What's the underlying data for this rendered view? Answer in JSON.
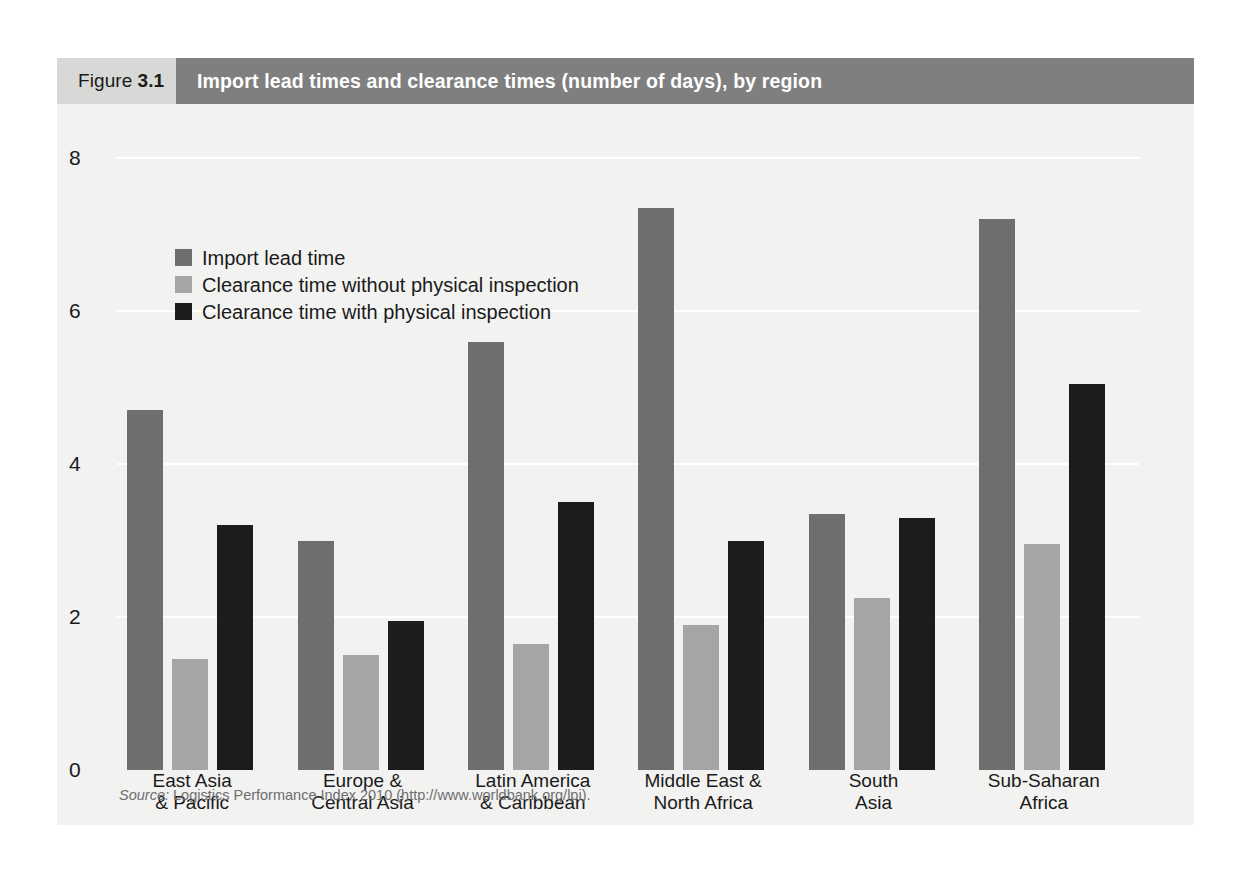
{
  "figure": {
    "label": "Figure",
    "number": "3.1",
    "title": "Import lead times and clearance times (number of days), by region",
    "source_word": "Source:",
    "source_text": " Logistics Performance Index 2010 (http://www.worldbank.org/lpi)."
  },
  "colors": {
    "header_number_bg": "#d8d8d6",
    "header_title_bg": "#7f7f7f",
    "panel_bg": "#f2f2f1",
    "series_import_lead_time": "#6e6e6e",
    "series_clearance_without": "#a5a5a5",
    "series_clearance_with": "#1c1c1c",
    "gridline": "#ffffff"
  },
  "chart_data": {
    "type": "bar",
    "title": "Import lead times and clearance times (number of days), by region",
    "xlabel": "",
    "ylabel": "",
    "ylim": [
      0,
      8
    ],
    "yticks": [
      0,
      2,
      4,
      6,
      8
    ],
    "ytick_labels": [
      "0",
      "2",
      "4",
      "6",
      "8"
    ],
    "grid": true,
    "legend_position": "top-left",
    "categories": [
      "East Asia\n& Pacific",
      "Europe &\nCentral Asia",
      "Latin America\n& Caribbean",
      "Middle East &\nNorth Africa",
      "South\nAsia",
      "Sub-Saharan\nAfrica"
    ],
    "series": [
      {
        "name": "Import lead time",
        "color": "#6e6e6e",
        "values": [
          4.7,
          3.0,
          5.6,
          7.35,
          3.35,
          7.2
        ]
      },
      {
        "name": "Clearance time without physical inspection",
        "color": "#a5a5a5",
        "values": [
          1.45,
          1.5,
          1.65,
          1.9,
          2.25,
          2.95
        ]
      },
      {
        "name": "Clearance time with physical inspection",
        "color": "#1c1c1c",
        "values": [
          3.2,
          1.95,
          3.5,
          3.0,
          3.3,
          5.05
        ]
      }
    ]
  }
}
